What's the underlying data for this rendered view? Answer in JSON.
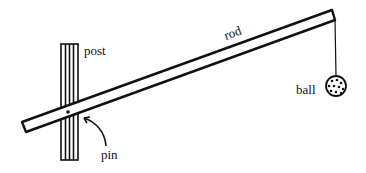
{
  "diagram": {
    "labels": {
      "post": "post",
      "rod": "rod",
      "ball": "ball",
      "pin": "pin"
    },
    "colors": {
      "ink": "#111111",
      "background": "#ffffff"
    }
  }
}
